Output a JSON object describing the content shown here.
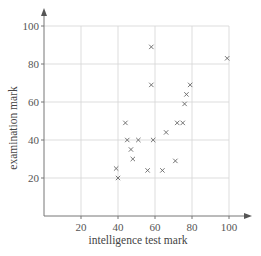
{
  "chart_data": {
    "type": "scatter",
    "title": "",
    "xlabel": "intelligence test mark",
    "ylabel": "examination mark",
    "xlim": [
      0,
      100
    ],
    "ylim": [
      0,
      100
    ],
    "xticks": [
      20,
      40,
      60,
      80,
      100
    ],
    "yticks": [
      20,
      40,
      60,
      80,
      100
    ],
    "grid": true,
    "marker": "x",
    "legend": null,
    "points": [
      {
        "x": 39,
        "y": 25
      },
      {
        "x": 40,
        "y": 20
      },
      {
        "x": 44,
        "y": 49
      },
      {
        "x": 45,
        "y": 40
      },
      {
        "x": 47,
        "y": 35
      },
      {
        "x": 48,
        "y": 30
      },
      {
        "x": 51,
        "y": 40
      },
      {
        "x": 56,
        "y": 24
      },
      {
        "x": 58,
        "y": 89
      },
      {
        "x": 58,
        "y": 69
      },
      {
        "x": 59,
        "y": 40
      },
      {
        "x": 64,
        "y": 24
      },
      {
        "x": 66,
        "y": 44
      },
      {
        "x": 71,
        "y": 29
      },
      {
        "x": 72,
        "y": 49
      },
      {
        "x": 75,
        "y": 49
      },
      {
        "x": 76,
        "y": 59
      },
      {
        "x": 77,
        "y": 64
      },
      {
        "x": 79,
        "y": 69
      },
      {
        "x": 99,
        "y": 83
      }
    ]
  },
  "colors": {
    "axis": "#777777",
    "grid": "#d4d4d4",
    "marker": "#666666",
    "text": "#444444"
  }
}
